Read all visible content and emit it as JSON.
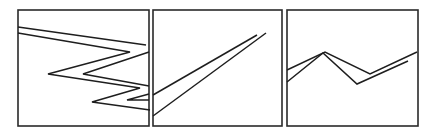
{
  "figure": {
    "panels": [
      {
        "id": "panel-1",
        "frame": {
          "x": 18,
          "y": 10,
          "w": 131,
          "h": 116
        },
        "paths": [
          "M18,27 L146,45",
          "M18,33 L130,52 L48,74 L140,88 L92,102 L150,110",
          "M149,52 L83,74 L149,86 M149,94 L127,100 L149,100"
        ]
      },
      {
        "id": "panel-2",
        "frame": {
          "x": 153,
          "y": 10,
          "w": 129,
          "h": 116
        },
        "paths": [
          "M153,95 L257,35",
          "M153,116 L266,33"
        ]
      },
      {
        "id": "panel-3",
        "frame": {
          "x": 287,
          "y": 10,
          "w": 131,
          "h": 116
        },
        "paths": [
          "M287,70 L325,52 L370,74 L417,52",
          "M287,82 L323,53 L357,84 L408,61"
        ]
      }
    ],
    "stroke_color": "#1e1e1e",
    "background": "#ffffff"
  }
}
